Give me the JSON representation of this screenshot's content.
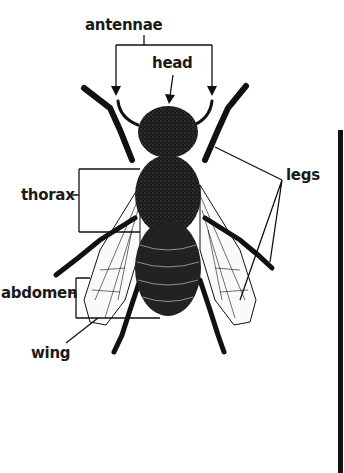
{
  "diagram": {
    "labels": {
      "antennae": "antennae",
      "head": "head",
      "legs": "legs",
      "thorax": "thorax",
      "abdomen": "abdomen",
      "wing": "wing"
    },
    "colors": {
      "ink": "#111111",
      "background": "#ffffff"
    }
  }
}
